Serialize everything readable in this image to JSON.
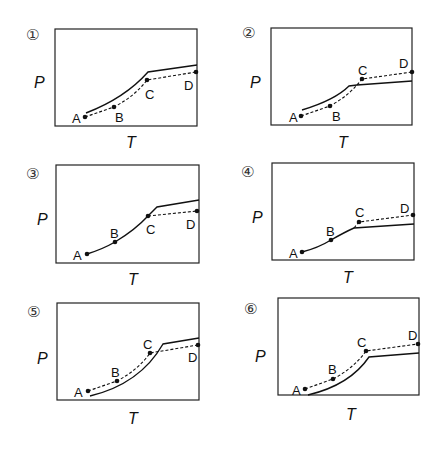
{
  "figure": {
    "axis_labels": {
      "x": "T",
      "y": "P"
    },
    "panels": [
      {
        "number": "①",
        "points": {
          "A": "A",
          "B": "B",
          "C": "C",
          "D": "D"
        }
      },
      {
        "number": "②",
        "points": {
          "A": "A",
          "B": "B",
          "C": "C",
          "D": "D"
        }
      },
      {
        "number": "③",
        "points": {
          "A": "A",
          "B": "B",
          "C": "C",
          "D": "D"
        }
      },
      {
        "number": "④",
        "points": {
          "A": "A",
          "B": "B",
          "C": "C",
          "D": "D"
        }
      },
      {
        "number": "⑤",
        "points": {
          "A": "A",
          "B": "B",
          "C": "C",
          "D": "D"
        }
      },
      {
        "number": "⑥",
        "points": {
          "A": "A",
          "B": "B",
          "C": "C",
          "D": "D"
        }
      }
    ]
  }
}
